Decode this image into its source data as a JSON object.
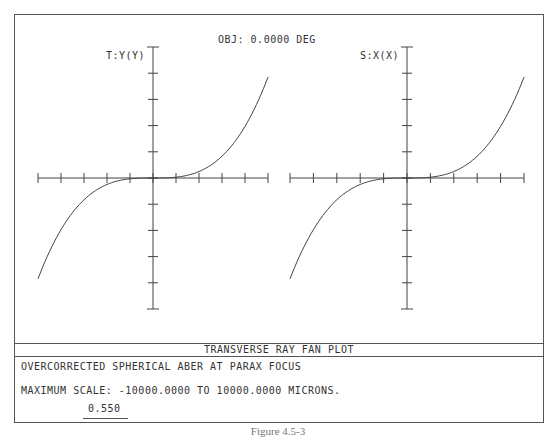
{
  "header": {
    "object_label": "OBJ: 0.0000 DEG"
  },
  "plots": [
    {
      "axis_label": "T:Y(Y)"
    },
    {
      "axis_label": "S:X(X)"
    }
  ],
  "footer": {
    "title": "TRANSVERSE RAY FAN PLOT",
    "description": "OVERCORRECTED SPHERICAL ABER AT PARAX FOCUS",
    "scale_text": "MAXIMUM SCALE: -10000.0000 TO 10000.0000 MICRONS.",
    "wavelength": "0.550"
  },
  "caption": "Figure 4.5-3",
  "colors": {
    "line": "#444444",
    "frame": "#555555",
    "background": "#ffffff"
  },
  "chart_data": [
    {
      "type": "line",
      "title": "T:Y(Y)",
      "xlabel": "Normalized pupil coordinate Y",
      "ylabel": "Transverse ray error (tangential)",
      "xlim": [
        -1,
        1
      ],
      "ylim": [
        -10000,
        10000
      ],
      "x_ticks": 10,
      "y_ticks": 10,
      "grid": false,
      "series": [
        {
          "name": "0.550",
          "x": [
            -1.0,
            -0.8,
            -0.6,
            -0.4,
            -0.2,
            0.0,
            0.2,
            0.4,
            0.6,
            0.8,
            1.0
          ],
          "y": [
            -7700,
            -4000,
            -1700,
            -500,
            -60,
            0,
            60,
            500,
            1700,
            4000,
            7700
          ]
        }
      ]
    },
    {
      "type": "line",
      "title": "S:X(X)",
      "xlabel": "Normalized pupil coordinate X",
      "ylabel": "Transverse ray error (sagittal)",
      "xlim": [
        -1,
        1
      ],
      "ylim": [
        -10000,
        10000
      ],
      "x_ticks": 10,
      "y_ticks": 10,
      "grid": false,
      "series": [
        {
          "name": "0.550",
          "x": [
            -1.0,
            -0.8,
            -0.6,
            -0.4,
            -0.2,
            0.0,
            0.2,
            0.4,
            0.6,
            0.8,
            1.0
          ],
          "y": [
            -7700,
            -4000,
            -1700,
            -500,
            -60,
            0,
            60,
            500,
            1700,
            4000,
            7700
          ]
        }
      ]
    }
  ]
}
